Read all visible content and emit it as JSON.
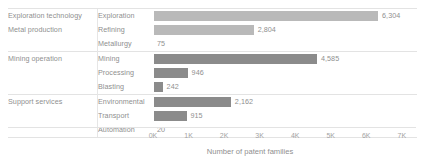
{
  "chart_data": {
    "type": "bar",
    "orientation": "horizontal",
    "title": "",
    "xlabel": "Number of patent families",
    "ylabel": "",
    "xlim": [
      0,
      7400
    ],
    "grid": false,
    "legend": null,
    "axis_ticks": [
      "0K",
      "1K",
      "2K",
      "3K",
      "4K",
      "5K",
      "6K",
      "7K"
    ],
    "axis_tick_values": [
      0,
      1000,
      2000,
      3000,
      4000,
      5000,
      6000,
      7000
    ],
    "groups": [
      {
        "group": "Exploration technology",
        "rows": [
          {
            "category": "Exploration",
            "value": 6304,
            "label": "6,304",
            "color": "#b9b9b9"
          }
        ]
      },
      {
        "group": "Metal production",
        "rows": [
          {
            "category": "Refining",
            "value": 2804,
            "label": "2,804",
            "color": "#b9b9b9"
          },
          {
            "category": "Metallurgy",
            "value": 75,
            "label": "75",
            "color": "#b9b9b9"
          }
        ]
      },
      {
        "group": "Mining operation",
        "rows": [
          {
            "category": "Mining",
            "value": 4585,
            "label": "4,585",
            "color": "#8b8b8b"
          },
          {
            "category": "Processing",
            "value": 946,
            "label": "946",
            "color": "#8b8b8b"
          },
          {
            "category": "Blasting",
            "value": 242,
            "label": "242",
            "color": "#8b8b8b"
          }
        ]
      },
      {
        "group": "Support services",
        "rows": [
          {
            "category": "Environmental",
            "value": 2162,
            "label": "2,162",
            "color": "#8b8b8b"
          },
          {
            "category": "Transport",
            "value": 915,
            "label": "915",
            "color": "#8b8b8b"
          },
          {
            "category": "Automation",
            "value": 20,
            "label": "20",
            "color": "#8b8b8b"
          }
        ]
      }
    ]
  }
}
